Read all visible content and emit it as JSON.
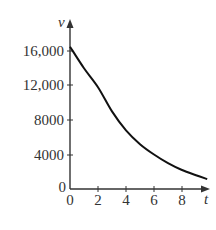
{
  "chart_data": {
    "type": "line",
    "title": "",
    "xlabel": "t",
    "ylabel": "v",
    "x_ticks": [
      0,
      2,
      4,
      6,
      8
    ],
    "x_tick_labels": [
      "0",
      "2",
      "4",
      "6",
      "8"
    ],
    "y_ticks": [
      0,
      4000,
      8000,
      12000,
      16000
    ],
    "y_tick_labels": [
      "0",
      "4000",
      "8000",
      "12,000",
      "16,000"
    ],
    "xlim": [
      0,
      10
    ],
    "ylim": [
      0,
      18000
    ],
    "grid": false,
    "legend": null,
    "series": [
      {
        "name": "v(t)",
        "x": [
          0,
          1,
          2,
          3,
          4,
          5,
          6,
          7,
          8,
          9,
          9.8
        ],
        "values": [
          16500,
          14000,
          11800,
          9000,
          6800,
          5200,
          4000,
          3000,
          2200,
          1600,
          1150
        ]
      }
    ],
    "colors": {
      "curve": "#111111",
      "axes": "#333333",
      "text": "#333333"
    }
  }
}
